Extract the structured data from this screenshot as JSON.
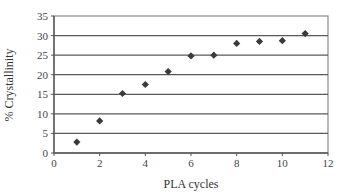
{
  "chart_data": {
    "type": "scatter",
    "title": "",
    "xlabel": "PLA cycles",
    "ylabel": "% Crystallinity",
    "xlim": [
      0,
      12
    ],
    "ylim": [
      0,
      35
    ],
    "xticks": [
      0,
      2,
      4,
      6,
      8,
      10,
      12
    ],
    "yticks": [
      0,
      5,
      10,
      15,
      20,
      25,
      30,
      35
    ],
    "grid": "horizontal",
    "legend": null,
    "marker": "diamond",
    "marker_color": "#3a3a3a",
    "series": [
      {
        "name": "% Crystallinity",
        "x": [
          1,
          2,
          3,
          4,
          5,
          6,
          7,
          8,
          9,
          10,
          11
        ],
        "y": [
          2.8,
          8.2,
          15.2,
          17.5,
          20.8,
          24.8,
          25.0,
          28.0,
          28.5,
          28.7,
          30.5
        ]
      }
    ]
  }
}
